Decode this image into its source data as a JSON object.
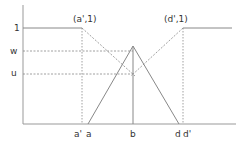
{
  "diagram": {
    "y_labels": {
      "one": "1",
      "w": "w",
      "u": "u"
    },
    "x_labels": {
      "a_prime": "a'",
      "a": "a",
      "b": "b",
      "d": "d",
      "d_prime": "d'"
    },
    "point_labels": {
      "a_prime_1": "(a',1)",
      "d_prime_1": "(d',1)"
    },
    "colors": {
      "axis": "#888888",
      "line": "#888888",
      "dashed": "#888888",
      "text": "#333333"
    }
  }
}
